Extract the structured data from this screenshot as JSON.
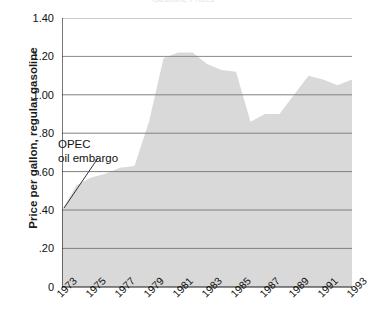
{
  "chart_data": {
    "type": "area",
    "title": "Gasoline Prices",
    "xlabel": "",
    "ylabel": "Price per gallon, regular gasoline",
    "xlim": [
      1973,
      1993
    ],
    "ylim": [
      0,
      1.4
    ],
    "grid": true,
    "legend": "none",
    "y_ticks": [
      "1.40",
      "1.20",
      "1.00",
      ".80",
      ".60",
      ".40",
      ".20",
      "0"
    ],
    "y_tick_values": [
      1.4,
      1.2,
      1.0,
      0.8,
      0.6,
      0.4,
      0.2,
      0
    ],
    "x_ticks": [
      "1973",
      "1975",
      "1977",
      "1979",
      "1981",
      "1983",
      "1985",
      "1987",
      "1989",
      "1991",
      "1993"
    ],
    "x_tick_values": [
      1973,
      1975,
      1977,
      1979,
      1981,
      1983,
      1985,
      1987,
      1989,
      1991,
      1993
    ],
    "x": [
      1973,
      1974,
      1975,
      1976,
      1977,
      1978,
      1979,
      1980,
      1981,
      1982,
      1983,
      1984,
      1985,
      1986,
      1987,
      1988,
      1989,
      1990,
      1991,
      1992,
      1993
    ],
    "values": [
      0.4,
      0.53,
      0.57,
      0.59,
      0.62,
      0.63,
      0.86,
      1.19,
      1.22,
      1.22,
      1.16,
      1.13,
      1.12,
      0.86,
      0.9,
      0.9,
      1.0,
      1.1,
      1.08,
      1.05,
      1.08
    ],
    "series": [
      {
        "name": "Price per gallon, regular gasoline",
        "values": [
          0.4,
          0.53,
          0.57,
          0.59,
          0.62,
          0.63,
          0.86,
          1.19,
          1.22,
          1.22,
          1.16,
          1.13,
          1.12,
          0.86,
          0.9,
          0.9,
          1.0,
          1.1,
          1.08,
          1.05,
          1.08
        ]
      }
    ],
    "annotations": [
      {
        "label_line_1": "OPEC",
        "label_line_2": "oil embargo",
        "points_to_year": 1973,
        "points_to_value": 0.4
      }
    ],
    "colors": {
      "area_fill": "#d9d9d9",
      "gridline": "#808080",
      "axis": "#1a1a1a",
      "text": "#111111"
    }
  },
  "annotation": {
    "line1": "OPEC",
    "line2": "oil embargo"
  }
}
